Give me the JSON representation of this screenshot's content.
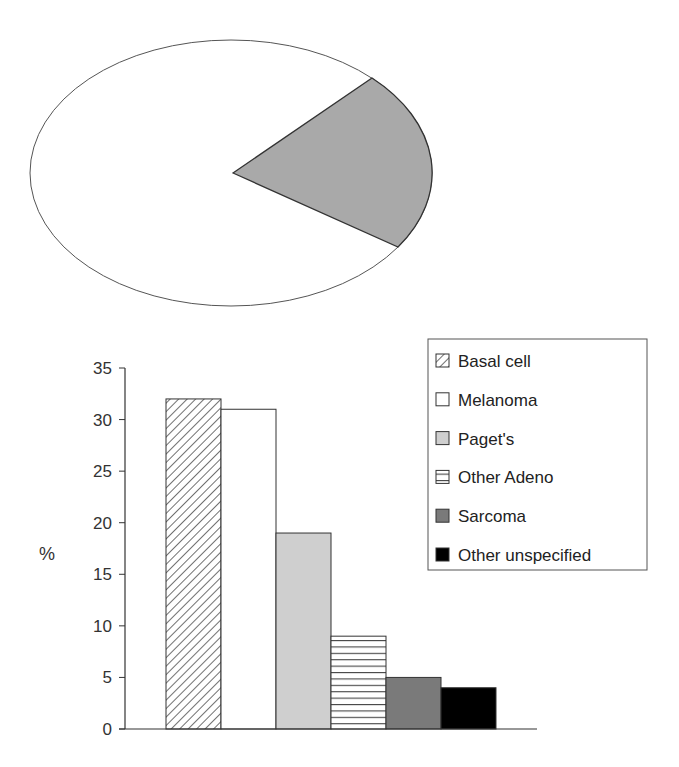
{
  "chart_data": [
    {
      "type": "pie",
      "title": "",
      "slices": [
        {
          "label": "",
          "value": 77,
          "color": "#ffffff"
        },
        {
          "label": "",
          "value": 23,
          "color": "#a9a9a9"
        }
      ]
    },
    {
      "type": "bar",
      "title": "",
      "xlabel": "",
      "ylabel": "%",
      "ylim": [
        0,
        35
      ],
      "yticks": [
        0,
        5,
        10,
        15,
        20,
        25,
        30,
        35
      ],
      "categories": [
        "Basal cell",
        "Melanoma",
        "Paget's",
        "Other Adeno",
        "Sarcoma",
        "Other unspecified"
      ],
      "values": [
        32,
        31,
        19,
        9,
        5,
        4
      ],
      "grid": false,
      "legend_position": "top-right",
      "legend": [
        {
          "label": "Basal cell",
          "fill": "diagonal-hatch"
        },
        {
          "label": "Melanoma",
          "fill": "#ffffff"
        },
        {
          "label": "Paget's",
          "fill": "#cfcfcf"
        },
        {
          "label": "Other Adeno",
          "fill": "horizontal-hatch"
        },
        {
          "label": "Sarcoma",
          "fill": "#7a7a7a"
        },
        {
          "label": "Other unspecified",
          "fill": "#000000"
        }
      ]
    }
  ]
}
